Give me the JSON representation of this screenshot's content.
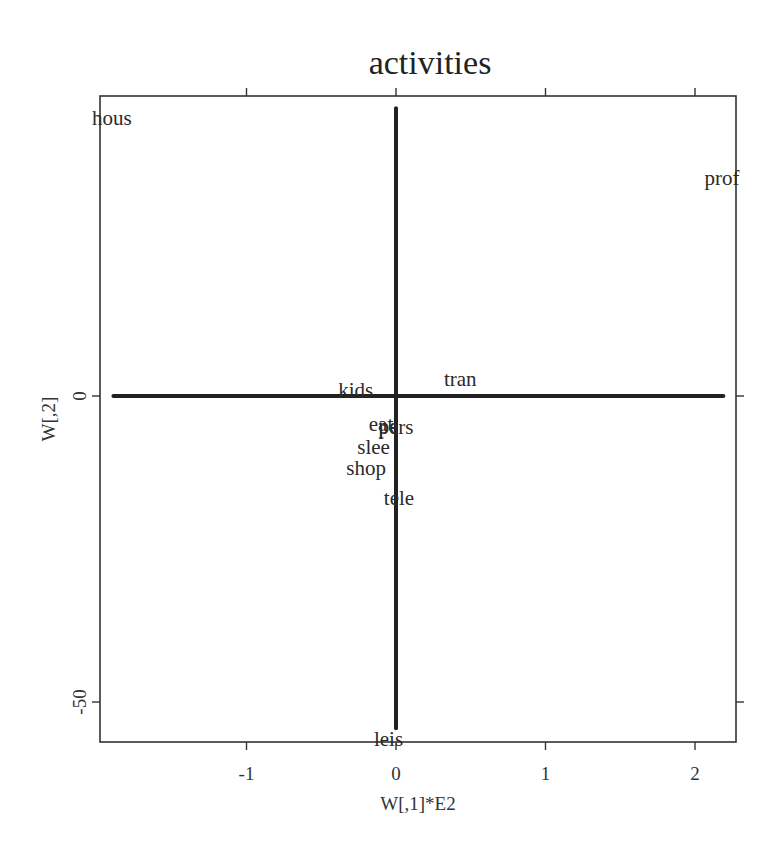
{
  "chart_data": {
    "type": "scatter",
    "title": "activities",
    "xlabel": "W[,1]*E2",
    "ylabel": "W[,2]",
    "xlim": [
      -2.0,
      2.28
    ],
    "ylim": [
      -57.5,
      48.0
    ],
    "grid": false,
    "legend": null,
    "x_ticks": [
      -1,
      0,
      1,
      2
    ],
    "x_tick_labels": [
      "-1",
      "0",
      "1",
      "2"
    ],
    "y_ticks": [
      0,
      -50
    ],
    "y_tick_labels": [
      "0",
      "-50"
    ],
    "reference_lines": [
      {
        "orientation": "horizontal",
        "y": 0,
        "x_from": -1.89,
        "x_to": 2.19
      },
      {
        "orientation": "vertical",
        "x": 0,
        "y_from": 47.0,
        "y_to": -54.3
      }
    ],
    "points": [
      {
        "label": "hous",
        "x": -1.9,
        "y": 45.4
      },
      {
        "label": "prof",
        "x": 2.18,
        "y": 35.6
      },
      {
        "label": "tran",
        "x": 0.43,
        "y": 2.8
      },
      {
        "label": "kids",
        "x": -0.27,
        "y": 1.0
      },
      {
        "label": "eat",
        "x": -0.1,
        "y": -4.6
      },
      {
        "label": "pe",
        "x": -0.05,
        "y": -4.9
      },
      {
        "label": "pers",
        "x": 0.0,
        "y": -5.1
      },
      {
        "label": "slee",
        "x": -0.15,
        "y": -8.3
      },
      {
        "label": "shop",
        "x": -0.2,
        "y": -11.8
      },
      {
        "label": "tele",
        "x": 0.02,
        "y": -16.7
      },
      {
        "label": "leis",
        "x": -0.05,
        "y": -56.0
      }
    ]
  },
  "colors": {
    "ink": "#222222",
    "background": "#ffffff"
  }
}
